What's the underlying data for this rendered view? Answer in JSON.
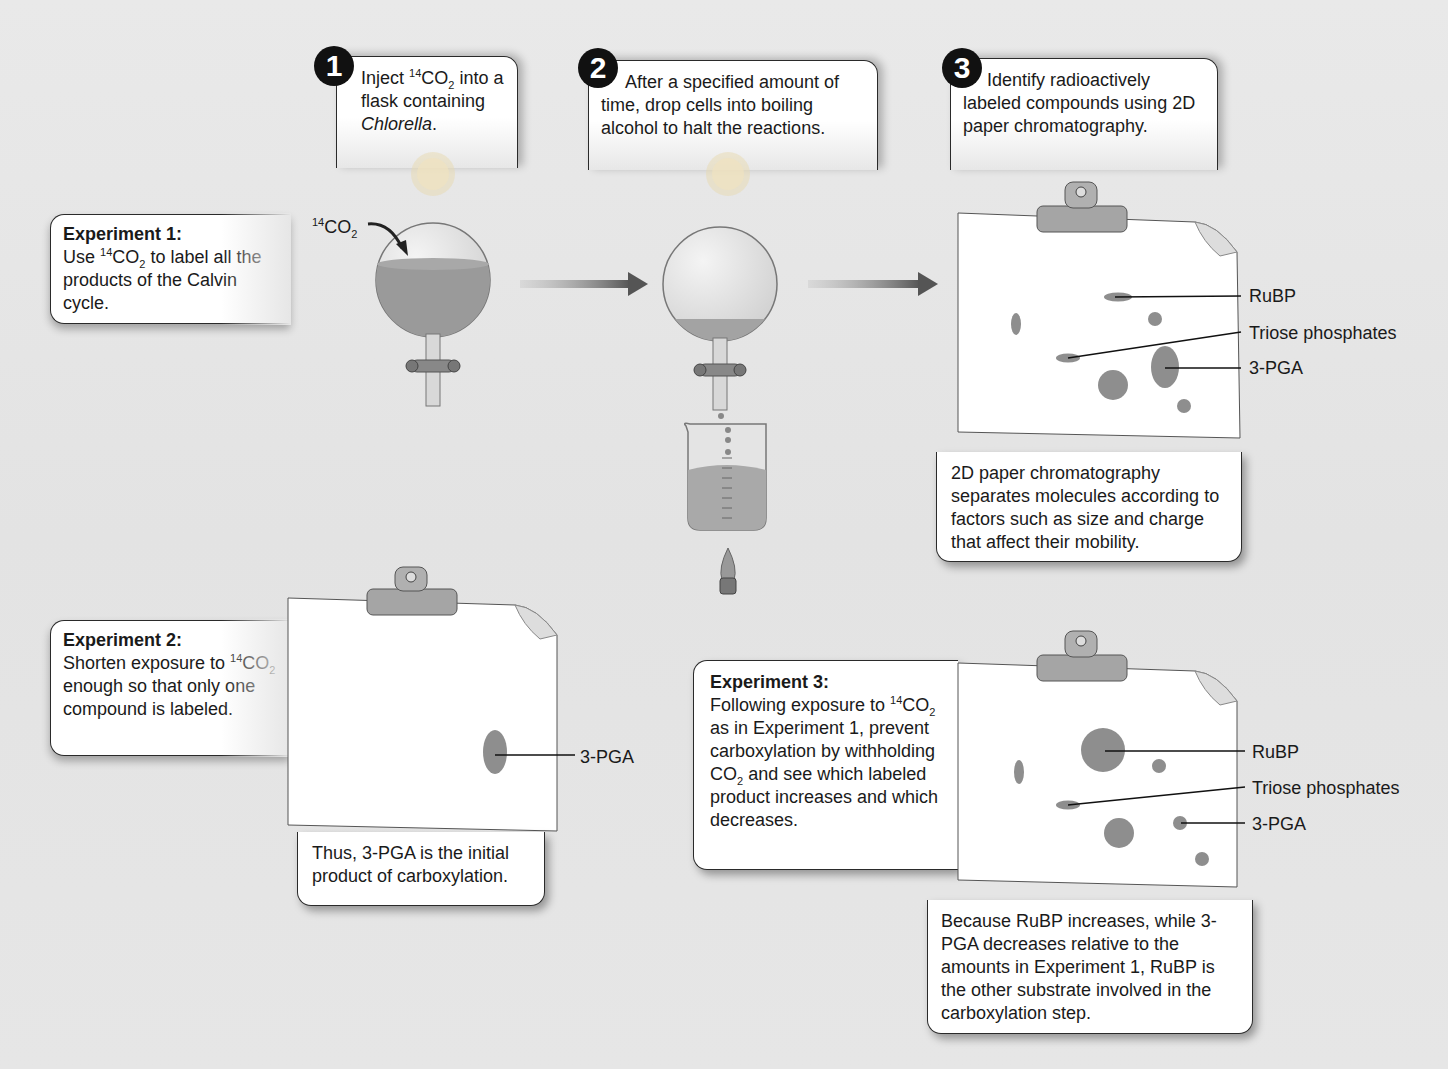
{
  "steps": [
    {
      "number": "1",
      "text_before": "Inject ",
      "sup": "14",
      "mid": "CO",
      "sub": "2",
      "text_after": " into a flask containing ",
      "italic": "Chlorella",
      "end": "."
    },
    {
      "number": "2",
      "text": "After a specified amount of time, drop cells into boiling alcohol to halt the reactions."
    },
    {
      "number": "3",
      "text": "Identify radioactively labeled compounds using 2D paper chromatography."
    }
  ],
  "experiments": [
    {
      "title": "Experiment 1:",
      "line1_pre": "Use ",
      "sup": "14",
      "mid": "CO",
      "sub": "2",
      "line1_post": " to label all the products of the Calvin cycle."
    },
    {
      "title": "Experiment 2:",
      "pre": "Shorten exposure to ",
      "sup": "14",
      "mid": "CO",
      "sub": "2",
      "post": " enough so that only one compound is labeled."
    },
    {
      "title": "Experiment 3:",
      "pre": "Following exposure to ",
      "sup": "14",
      "mid": "CO",
      "sub": "2",
      "post1": " as in Experiment 1, prevent carboxylation by withholding CO",
      "sub2": "2",
      "post2": " and see which labeled product increases and which decreases."
    }
  ],
  "flask_label": {
    "sup": "14",
    "mid": "CO",
    "sub": "2"
  },
  "chromatogram_labels": {
    "rubp": "RuBP",
    "triose": "Triose phosphates",
    "pga": "3-PGA"
  },
  "notes": {
    "chromatography": "2D paper chromatography separates molecules according to factors such as size and charge that affect their mobility.",
    "exp2_conclusion": "Thus, 3-PGA is the initial product of carboxylation.",
    "exp3_conclusion": "Because RuBP increases, while 3-PGA decreases relative to the amounts in Experiment 1, RuBP is the other substrate involved in the carboxylation step."
  },
  "colors": {
    "spot": "#8e8e8e",
    "liquid": "#9a9a9a",
    "arrow": "#555555",
    "background": "#e6e6e6"
  }
}
